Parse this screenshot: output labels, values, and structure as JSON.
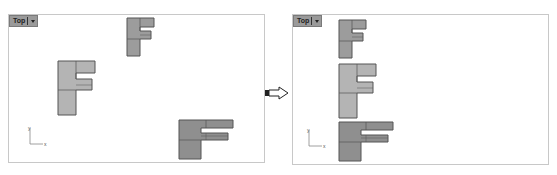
{
  "left_viewport": {
    "label": "Top",
    "axis": {
      "x": "x",
      "y": "y"
    },
    "shapes": [
      {
        "name": "F-small",
        "x": 126,
        "y": 17,
        "scale": 0.6
      },
      {
        "name": "F-medium",
        "x": 57,
        "y": 60,
        "scale": 0.9
      },
      {
        "name": "F-large",
        "x": 178,
        "y": 120,
        "scale": 1.0
      }
    ]
  },
  "arrow": {
    "direction": "right"
  },
  "right_viewport": {
    "label": "Top",
    "axis": {
      "x": "x",
      "y": "y"
    },
    "shapes": [
      {
        "name": "F-small",
        "x": 338,
        "y": 19,
        "scale": 0.6
      },
      {
        "name": "F-medium",
        "x": 338,
        "y": 63,
        "scale": 0.9
      },
      {
        "name": "F-large",
        "x": 338,
        "y": 122,
        "scale": 1.0
      }
    ]
  },
  "colors": {
    "fill": "#a9a9a9",
    "fill_dark": "#8f8f8f",
    "stroke": "#555555",
    "border": "#c8c8c8",
    "tab": "#9a9a9a"
  }
}
